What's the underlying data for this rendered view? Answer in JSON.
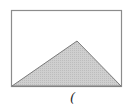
{
  "diagram": {
    "frame": {
      "x1": 11.5,
      "y1": 10.5,
      "x2": 121.5,
      "y2": 86.5,
      "stroke": "#8c8c8c"
    },
    "triangle": {
      "points": "12,86 77,41 121,86",
      "fill": "#c8c8c8",
      "stroke": "#7a7a7a"
    },
    "caption": "("
  }
}
